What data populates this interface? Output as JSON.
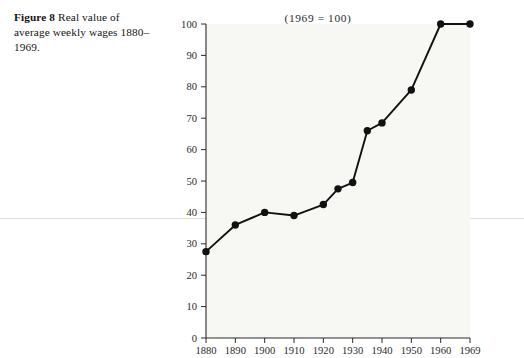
{
  "caption": {
    "lead": "Figure 8",
    "text": "Real value of average weekly wages 1880–1969."
  },
  "chart_data": {
    "type": "line",
    "title": "(1969 = 100)",
    "xlabel": "",
    "ylabel": "",
    "xlim": [
      1880,
      1969
    ],
    "ylim": [
      0,
      100
    ],
    "grid": false,
    "legend": null,
    "marker": "filled-circle",
    "line_color": "#111111",
    "marker_color": "#111111",
    "plot_background": "#f7f7f4",
    "x_ticks": [
      1880,
      1890,
      1900,
      1910,
      1920,
      1930,
      1940,
      1950,
      1960,
      1969
    ],
    "x_tick_labels": [
      "1880",
      "1890",
      "1900",
      "1910",
      "1920",
      "1930",
      "1940",
      "1950",
      "1960",
      "1969"
    ],
    "y_ticks": [
      0,
      10,
      20,
      30,
      40,
      50,
      60,
      70,
      80,
      90,
      100
    ],
    "y_tick_labels": [
      "0",
      "10",
      "20",
      "30",
      "40",
      "50",
      "60",
      "70",
      "80",
      "90",
      "100"
    ],
    "x": [
      1880,
      1890,
      1900,
      1910,
      1920,
      1925,
      1930,
      1935,
      1940,
      1950,
      1960,
      1969
    ],
    "values": [
      27.5,
      36.0,
      40.0,
      39.0,
      42.5,
      47.5,
      49.5,
      66.0,
      68.5,
      79.0,
      100.0,
      100.0
    ],
    "points": [
      {
        "x": 1880,
        "y": 27.5
      },
      {
        "x": 1890,
        "y": 36.0
      },
      {
        "x": 1900,
        "y": 40.0
      },
      {
        "x": 1910,
        "y": 39.0
      },
      {
        "x": 1920,
        "y": 42.5
      },
      {
        "x": 1925,
        "y": 47.5
      },
      {
        "x": 1930,
        "y": 49.5
      },
      {
        "x": 1935,
        "y": 66.0
      },
      {
        "x": 1940,
        "y": 68.5
      },
      {
        "x": 1950,
        "y": 79.0
      },
      {
        "x": 1960,
        "y": 100.0
      }
    ]
  }
}
